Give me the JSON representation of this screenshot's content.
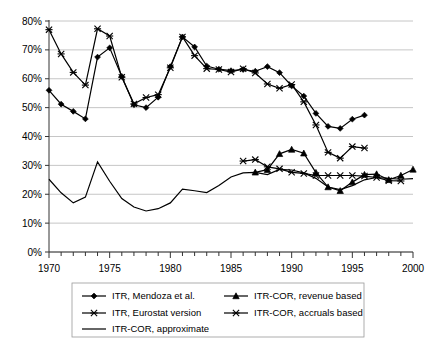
{
  "chart_data": {
    "type": "line",
    "title": "",
    "xlabel": "",
    "ylabel": "",
    "xlim": [
      1970,
      2000
    ],
    "ylim": [
      0,
      80
    ],
    "grid": true,
    "legend_position": "bottom",
    "x_ticks": [
      1970,
      1975,
      1980,
      1985,
      1990,
      1995,
      2000
    ],
    "x_tick_labels": [
      "1970",
      "1975",
      "1980",
      "1985",
      "1990",
      "1995",
      "2000"
    ],
    "x_minor_tick_step": 1,
    "y_ticks": [
      0,
      10,
      20,
      30,
      40,
      50,
      60,
      70,
      80
    ],
    "y_tick_labels": [
      "0%",
      "10%",
      "20%",
      "30%",
      "40%",
      "50%",
      "60%",
      "70%",
      "80%"
    ],
    "series": [
      {
        "name": "ITR, Mendoza et al.",
        "marker": "diamond",
        "x": [
          1970,
          1971,
          1972,
          1973,
          1974,
          1975,
          1976,
          1977,
          1978,
          1979,
          1980,
          1981,
          1982,
          1983,
          1984,
          1985,
          1986,
          1987,
          1988,
          1989,
          1990,
          1991,
          1992,
          1993,
          1994,
          1995,
          1996
        ],
        "values": [
          56.0,
          51.2,
          48.7,
          46.1,
          67.5,
          70.7,
          60.8,
          51.0,
          50.0,
          53.6,
          64.2,
          74.5,
          71.0,
          64.4,
          63.3,
          62.8,
          63.2,
          62.6,
          64.2,
          62.1,
          57.5,
          54.0,
          48.0,
          43.5,
          42.8,
          46.0,
          47.4
        ]
      },
      {
        "name": "ITR, Eurostat version",
        "marker": "star",
        "x": [
          1970,
          1971,
          1972,
          1973,
          1974,
          1975,
          1976,
          1977,
          1978,
          1979,
          1980,
          1981,
          1982,
          1983,
          1984,
          1985,
          1986,
          1987,
          1988,
          1989,
          1990,
          1991,
          1992,
          1993,
          1994,
          1995,
          1996
        ],
        "values": [
          77.0,
          68.6,
          62.2,
          57.8,
          77.3,
          74.8,
          60.5,
          51.3,
          53.5,
          54.5,
          63.8,
          74.5,
          68.0,
          63.5,
          63.2,
          62.3,
          63.5,
          62.0,
          58.2,
          56.7,
          58.0,
          52.0,
          44.0,
          34.5,
          32.5,
          36.5,
          36.0
        ]
      },
      {
        "name": "ITR-COR, approximate",
        "marker": "none",
        "x": [
          1970,
          1971,
          1972,
          1973,
          1974,
          1975,
          1976,
          1977,
          1978,
          1979,
          1980,
          1981,
          1982,
          1983,
          1984,
          1985,
          1986,
          1987,
          1988,
          1989,
          1990,
          1991,
          1992,
          1993,
          1994,
          1995,
          1996,
          1997,
          1998,
          1999,
          2000
        ],
        "values": [
          25.2,
          20.5,
          17.0,
          19.0,
          31.2,
          24.5,
          18.5,
          15.6,
          14.2,
          15.0,
          17.0,
          21.8,
          21.2,
          20.6,
          23.0,
          26.0,
          27.4,
          27.6,
          26.8,
          28.6,
          28.4,
          27.4,
          25.5,
          22.5,
          21.6,
          23.0,
          25.0,
          25.8,
          25.5,
          25.2,
          25.4
        ]
      },
      {
        "name": "ITR-COR, revenue based",
        "marker": "triangle",
        "x": [
          1987,
          1988,
          1989,
          1990,
          1991,
          1992,
          1993,
          1994,
          1995,
          1996,
          1997,
          1998,
          1999,
          2000
        ],
        "values": [
          27.6,
          28.5,
          34.0,
          35.5,
          34.2,
          27.5,
          22.5,
          21.2,
          24.2,
          26.8,
          27.0,
          25.0,
          26.5,
          28.6
        ]
      },
      {
        "name": "ITR-COR, accruals based",
        "marker": "star",
        "x": [
          1986,
          1987,
          1988,
          1989,
          1990,
          1991,
          1992,
          1993,
          1994,
          1995,
          1996,
          1997,
          1998,
          1999
        ],
        "values": [
          31.5,
          32.0,
          29.5,
          28.8,
          27.6,
          27.2,
          26.5,
          26.5,
          26.5,
          26.5,
          26.3,
          25.8,
          24.7,
          24.6
        ]
      }
    ]
  },
  "legend": {
    "entries": [
      {
        "label": "ITR, Mendoza et al.",
        "marker": "diamond"
      },
      {
        "label": "ITR-COR, revenue based",
        "marker": "triangle"
      },
      {
        "label": "ITR, Eurostat version",
        "marker": "star"
      },
      {
        "label": "ITR-COR, accruals based",
        "marker": "star"
      },
      {
        "label": "ITR-COR, approximate",
        "marker": "none"
      }
    ]
  },
  "colors": {
    "line": "#000000",
    "grid": "#b8b8b8",
    "axis": "#333333",
    "background": "#ffffff",
    "legend_border": "#999999"
  }
}
